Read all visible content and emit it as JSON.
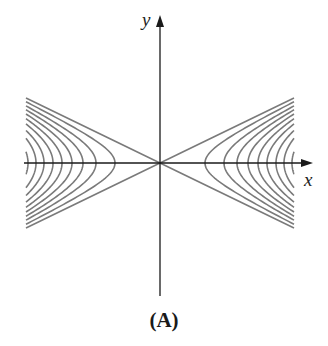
{
  "figure": {
    "caption": "(A)",
    "x_label": "x",
    "y_label": "y",
    "colors": {
      "axis": "#1a1a1a",
      "curve": "#7a7a7a",
      "background": "#ffffff"
    },
    "origin_px": [
      160,
      163
    ],
    "x_extent_px": [
      26,
      294
    ],
    "asymptote_half_height_px": 65
  },
  "chart_data": {
    "type": "contour",
    "title": "(A)",
    "xlabel": "x",
    "ylabel": "y",
    "asymptotes": [
      "y = 0.485x",
      "y = -0.485x"
    ],
    "vertex_x_right_px": [
      205,
      224,
      237,
      248,
      258,
      267,
      276,
      284,
      292
    ],
    "vertex_x_left_px": [
      115,
      96,
      83,
      72,
      62,
      53,
      44,
      36,
      28
    ],
    "curve_count_per_side": 9,
    "grid": false,
    "legend": null
  }
}
